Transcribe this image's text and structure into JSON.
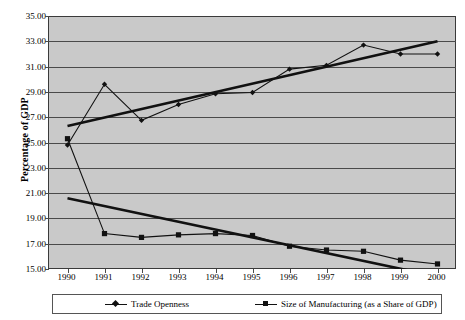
{
  "chart_data": {
    "type": "line",
    "title": "",
    "xlabel": "",
    "ylabel": "Percentage of GDP",
    "categories": [
      "1990",
      "1991",
      "1992",
      "1993",
      "1994",
      "1995",
      "1996",
      "1997",
      "1998",
      "1999",
      "2000"
    ],
    "ylim": [
      15.0,
      35.0
    ],
    "ytick_step": 2.0,
    "ytick_labels": [
      "35.00",
      "33.00",
      "31.00",
      "29.00",
      "27.00",
      "25.00",
      "23.00",
      "21.00",
      "19.00",
      "17.00",
      "15.00"
    ],
    "ytick_values": [
      35.0,
      33.0,
      31.0,
      29.0,
      27.0,
      25.0,
      23.0,
      21.0,
      19.0,
      17.0,
      15.0
    ],
    "grid": true,
    "legend_position": "bottom",
    "plot_background": "#c9c9c9",
    "series": [
      {
        "name": "Trade Openness",
        "marker": "diamond",
        "color": "#111111",
        "values": [
          24.8,
          29.6,
          26.75,
          28.0,
          28.85,
          28.95,
          30.8,
          31.1,
          32.7,
          32.0,
          32.0
        ]
      },
      {
        "name": "Size of Manufacturing (as a Share of GDP)",
        "marker": "square",
        "color": "#111111",
        "values": [
          25.3,
          17.8,
          17.5,
          17.7,
          17.8,
          17.65,
          16.8,
          16.5,
          16.4,
          15.7,
          15.4
        ]
      }
    ],
    "trendlines": [
      {
        "for_series": "Trade Openness",
        "start": {
          "x": 1990.0,
          "y": 26.3
        },
        "end": {
          "x": 2000.0,
          "y": 33.0
        }
      },
      {
        "for_series": "Size of Manufacturing (as a Share of GDP)",
        "start": {
          "x": 1990.0,
          "y": 20.6
        },
        "end": {
          "x": 2000.0,
          "y": 14.4
        }
      }
    ]
  },
  "legend": {
    "entries": [
      {
        "label": "Trade Openness",
        "marker": "diamond"
      },
      {
        "label": "Size of Manufacturing (as a Share of GDP)",
        "marker": "square"
      }
    ]
  }
}
